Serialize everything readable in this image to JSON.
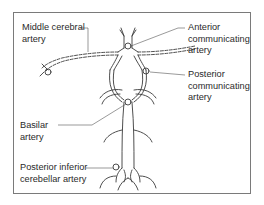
{
  "diagram": {
    "type": "anatomical-diagram",
    "labels": {
      "middle_cerebral": "Middle cerebral\nartery",
      "anterior_communicating": "Anterior\ncommunicating\nartery",
      "posterior_communicating": "Posterior\ncommunicating\nartery",
      "basilar": "Basilar\nartery",
      "posterior_inferior_cerebellar": "Posterior inferior\ncerebellar artery"
    },
    "colors": {
      "line": "#3a3a3a",
      "leader": "#555555",
      "frame": "#7a7a7a",
      "text": "#2a2a2a"
    }
  }
}
